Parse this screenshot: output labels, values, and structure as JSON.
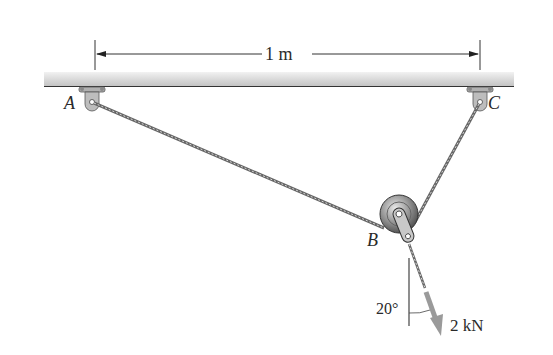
{
  "diagram": {
    "dimension_label": "1 m",
    "points": {
      "A": {
        "label": "A"
      },
      "B": {
        "label": "B"
      },
      "C": {
        "label": "C"
      }
    },
    "angle_label": "20°",
    "force_label": "2 kN",
    "colors": {
      "ceiling": "#d9d9d9",
      "cable": "#6b6b6b",
      "pulley": "#8a8a8a",
      "force_arrow": "#9a9a9a",
      "text": "#2a2a2a"
    }
  }
}
